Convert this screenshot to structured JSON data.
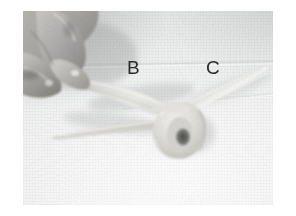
{
  "figure": {
    "kind": "grayscale-photograph",
    "page_background": "#ffffff",
    "photo": {
      "left": 23,
      "top": 11,
      "width": 250,
      "height": 194,
      "tone_light": "#fbfbfb",
      "tone_mid": "#e9eaea",
      "tone_dark": "#8e8f8f"
    },
    "annotations": [
      {
        "id": "letter-b",
        "label": "B",
        "x": 104,
        "y": 47,
        "color": "#2c2c2c"
      },
      {
        "id": "letter-c",
        "label": "C",
        "x": 183,
        "y": 47,
        "color": "#2c2c2c"
      }
    ],
    "elements": {
      "hand": "hand with thumb and index finger pressing dough, upper left",
      "dough_strand_b": "tapered dough strand segment labeled B running from finger toward the knot",
      "dough_loop": "closed loop / knot of dough with dark central hole, center of image",
      "dough_strand_c": "faint pale dough strand segment labeled C running up to the right",
      "dough_strand_left": "long tapered dough tail pointing left",
      "surface": "pale woven cloth work surface"
    }
  }
}
